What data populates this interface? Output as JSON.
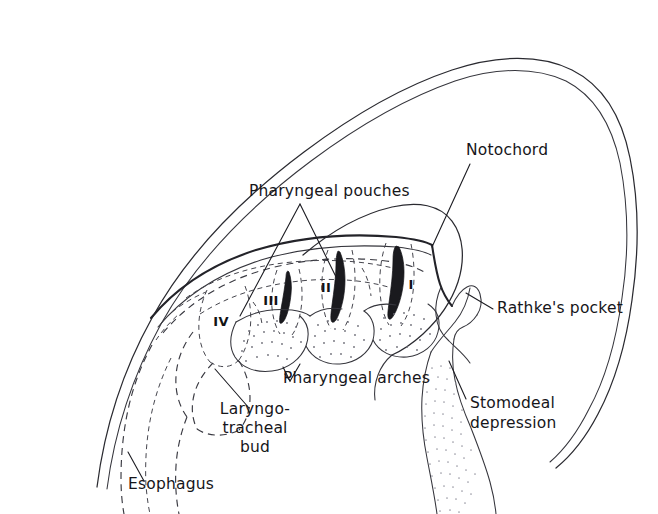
{
  "figure": {
    "domain": "anatomical line diagram",
    "background_color": "#ffffff",
    "ink_color": "#1c1c22"
  },
  "labels": {
    "pharyngeal_pouches": "Pharyngeal pouches",
    "notochord": "Notochord",
    "rathkes_pocket": "Rathke's pocket",
    "stomodeal_line1": "Stomodeal",
    "stomodeal_line2": "depression",
    "pharyngeal_arches": "Pharyngeal arches",
    "laryngotracheal_line1": "Laryngo-",
    "laryngotracheal_line2": "tracheal",
    "laryngotracheal_line3": "bud",
    "esophagus": "Esophagus"
  },
  "pouch_numerals": [
    {
      "id": "pouch-1",
      "text": "I",
      "x": 411,
      "y": 289
    },
    {
      "id": "pouch-2",
      "text": "II",
      "x": 326,
      "y": 292
    },
    {
      "id": "pouch-3",
      "text": "III",
      "x": 271,
      "y": 305
    },
    {
      "id": "pouch-4",
      "text": "IV",
      "x": 221,
      "y": 326
    }
  ],
  "label_positions": {
    "pharyngeal_pouches": {
      "x": 249,
      "y": 196
    },
    "notochord": {
      "x": 466,
      "y": 155
    },
    "rathkes_pocket": {
      "x": 497,
      "y": 313
    },
    "stomodeal": {
      "x": 470,
      "y": 408
    },
    "pharyngeal_arches": {
      "x": 283,
      "y": 383
    },
    "laryngotracheal": {
      "x": 255,
      "y": 414
    },
    "esophagus": {
      "x": 128,
      "y": 489
    }
  },
  "colors": {
    "outline": "#2a2a30",
    "dashed": "#3a3a42",
    "pouch_fill": "#1a1a1e",
    "stipple": "#6e6e78",
    "text": "#16161a"
  }
}
